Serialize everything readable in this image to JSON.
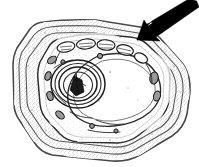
{
  "figure": {
    "title": "Plant cell cross-section diagram",
    "caption": "",
    "background_color": "#ffffff",
    "line_color": "#1f1f1f",
    "arrow_color": "#000000",
    "width_px": 199,
    "height_px": 167,
    "style": "halftone scanned line drawing"
  },
  "annotation": {
    "arrow_label": "",
    "arrow_points_to": "cell-wall",
    "tip_x": 138,
    "tip_y": 39,
    "tail_x": 197,
    "tail_y": 2
  },
  "structures": [
    {
      "id": "cell-wall",
      "label": "",
      "description": "thick stippled outer cell wall"
    },
    {
      "id": "cell-membrane",
      "label": "",
      "description": "inner plasma membrane layer"
    },
    {
      "id": "vacuole",
      "label": "",
      "description": "large central vacuole"
    },
    {
      "id": "nucleus",
      "label": "",
      "description": "nucleus with concentric envelope"
    },
    {
      "id": "nucleolus",
      "label": "",
      "description": "dense nucleolus"
    },
    {
      "id": "chloroplasts",
      "label": "",
      "description": "elongated chloroplasts along upper margin"
    },
    {
      "id": "mitochondria",
      "label": "",
      "description": "small oval mitochondria"
    },
    {
      "id": "endoplasmic-reticulum",
      "label": "",
      "description": "membrane strands near nucleus"
    }
  ]
}
